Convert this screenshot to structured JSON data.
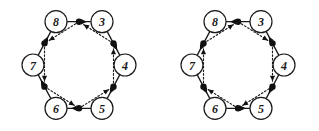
{
  "figure": {
    "background_color": "#ffffff",
    "ink_color": "#1a1a1a",
    "dot_color": "#111111",
    "width": 319,
    "height": 131,
    "panel_count": 2
  },
  "geometry": {
    "node_radius": 11,
    "dot_radius": 3.2,
    "hex_radius_x": 46,
    "hex_radius_y": 50,
    "panel_centers": [
      {
        "cx": 79,
        "cy": 65
      },
      {
        "cx": 238,
        "cy": 65
      }
    ],
    "vertex_angles_deg": [
      240,
      300,
      0,
      60,
      120,
      180
    ]
  },
  "panels": [
    {
      "id": "left-diagram",
      "name": "left-hexagon-diagram",
      "orientation": "clockwise",
      "nodes": [
        {
          "id": "n8",
          "label": "8",
          "position": "top-left"
        },
        {
          "id": "n3",
          "label": "3",
          "position": "top-right"
        },
        {
          "id": "n4",
          "label": "4",
          "position": "right"
        },
        {
          "id": "n5",
          "label": "5",
          "position": "bottom-right"
        },
        {
          "id": "n6",
          "label": "6",
          "position": "bottom-left"
        },
        {
          "id": "n7",
          "label": "7",
          "position": "left"
        }
      ],
      "outer_edges": [
        {
          "from": "8",
          "to": "3",
          "style": "solid",
          "direction": "forward",
          "has_midpoint_dot": true
        },
        {
          "from": "3",
          "to": "4",
          "style": "solid",
          "direction": "forward",
          "has_midpoint_dot": true
        },
        {
          "from": "4",
          "to": "5",
          "style": "solid",
          "direction": "forward",
          "has_midpoint_dot": true
        },
        {
          "from": "5",
          "to": "6",
          "style": "solid",
          "direction": "forward",
          "has_midpoint_dot": true
        },
        {
          "from": "6",
          "to": "7",
          "style": "solid",
          "direction": "forward",
          "has_midpoint_dot": true
        },
        {
          "from": "7",
          "to": "8",
          "style": "solid",
          "direction": "forward",
          "has_midpoint_dot": true
        }
      ],
      "inner_edges": [
        {
          "from": "m83",
          "to": "m78",
          "style": "dotted",
          "direction": "forward"
        },
        {
          "from": "m34",
          "to": "m83",
          "style": "dotted",
          "direction": "forward"
        },
        {
          "from": "m45",
          "to": "m34",
          "style": "dotted",
          "direction": "forward"
        },
        {
          "from": "m56",
          "to": "m45",
          "style": "dotted",
          "direction": "forward"
        },
        {
          "from": "m67",
          "to": "m56",
          "style": "dotted",
          "direction": "forward"
        },
        {
          "from": "m78",
          "to": "m67",
          "style": "dotted",
          "direction": "forward"
        }
      ]
    },
    {
      "id": "right-diagram",
      "name": "right-hexagon-diagram",
      "orientation": "counter-clockwise",
      "nodes": [
        {
          "id": "n8",
          "label": "8",
          "position": "top-left"
        },
        {
          "id": "n3",
          "label": "3",
          "position": "top-right"
        },
        {
          "id": "n4",
          "label": "4",
          "position": "right"
        },
        {
          "id": "n5",
          "label": "5",
          "position": "bottom-right"
        },
        {
          "id": "n6",
          "label": "6",
          "position": "bottom-left"
        },
        {
          "id": "n7",
          "label": "7",
          "position": "left"
        }
      ],
      "outer_edges": [
        {
          "from": "3",
          "to": "8",
          "style": "solid",
          "direction": "reverse",
          "has_midpoint_dot": true
        },
        {
          "from": "4",
          "to": "3",
          "style": "solid",
          "direction": "reverse",
          "has_midpoint_dot": true
        },
        {
          "from": "4",
          "to": "5",
          "style": "solid",
          "direction": "forward",
          "has_midpoint_dot": true
        },
        {
          "from": "6",
          "to": "5",
          "style": "solid",
          "direction": "reverse",
          "has_midpoint_dot": true
        },
        {
          "from": "7",
          "to": "6",
          "style": "solid",
          "direction": "forward",
          "has_midpoint_dot": true
        },
        {
          "from": "8",
          "to": "7",
          "style": "solid",
          "direction": "forward",
          "has_midpoint_dot": true
        }
      ],
      "inner_edges": [
        {
          "from": "m78",
          "to": "m83",
          "style": "dotted",
          "direction": "forward"
        },
        {
          "from": "m83",
          "to": "m34",
          "style": "dotted",
          "direction": "forward"
        },
        {
          "from": "m34",
          "to": "m45",
          "style": "dotted",
          "direction": "forward"
        },
        {
          "from": "m45",
          "to": "m56",
          "style": "dotted",
          "direction": "forward"
        },
        {
          "from": "m56",
          "to": "m67",
          "style": "dotted",
          "direction": "forward"
        },
        {
          "from": "m67",
          "to": "m78",
          "style": "dotted",
          "direction": "forward"
        }
      ]
    }
  ]
}
